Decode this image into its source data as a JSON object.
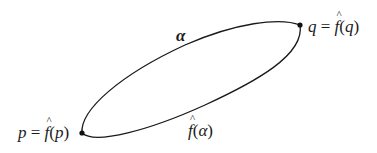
{
  "diagram": {
    "stroke_color": "#1a1a1a",
    "background": "#ffffff",
    "points": [
      {
        "id": "p",
        "x": 82,
        "y": 133
      },
      {
        "id": "q",
        "x": 300,
        "y": 25
      }
    ],
    "curves": [
      {
        "id": "alpha",
        "description": "upper arc from p to q"
      },
      {
        "id": "f_hat_alpha",
        "description": "lower arc from p to q"
      }
    ],
    "labels": {
      "alpha": {
        "text": "α"
      },
      "f_alpha": {
        "f": "f",
        "open": "(",
        "arg": "α",
        "close": ")"
      },
      "p_label": {
        "lhs": "p",
        "eq": " = ",
        "f": "f",
        "open": "(",
        "arg": "p",
        "close": ")"
      },
      "q_label": {
        "lhs": "q",
        "eq": " = ",
        "f": "f",
        "open": "(",
        "arg": "q",
        "close": ")"
      }
    }
  }
}
